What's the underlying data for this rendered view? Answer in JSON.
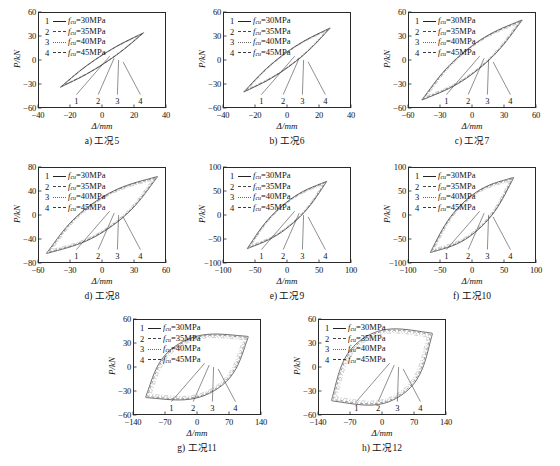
{
  "figure": {
    "axis_labels": {
      "x": "Δ/mm",
      "y": "P/kN"
    },
    "legend_series": [
      {
        "num": "1",
        "style": "solid",
        "label": "fcu=30MPa",
        "value": 30,
        "unit": "MPa"
      },
      {
        "num": "2",
        "style": "dash",
        "label": "fcu=35MPa",
        "value": 35,
        "unit": "MPa"
      },
      {
        "num": "3",
        "style": "dot",
        "label": "fcu=40MPa",
        "value": 40,
        "unit": "MPa"
      },
      {
        "num": "4",
        "style": "dashdot",
        "label": "fcu=45MPa",
        "value": 45,
        "unit": "MPa"
      }
    ],
    "callout_numbers": [
      "1",
      "2",
      "3",
      "4"
    ],
    "panels": [
      {
        "key": "a",
        "caption": "a) 工况5",
        "xlim": [
          -40,
          40
        ],
        "ylim": [
          -60,
          60
        ],
        "xticks": [
          -40,
          -20,
          0,
          20,
          40
        ],
        "yticks": [
          -60,
          -30,
          0,
          30,
          60
        ],
        "loop": "thin",
        "xpeak": 26,
        "ypeak": 34,
        "fatness": 0.1
      },
      {
        "key": "b",
        "caption": "b) 工况6",
        "xlim": [
          -40,
          40
        ],
        "ylim": [
          -60,
          60
        ],
        "xticks": [
          -40,
          -20,
          0,
          20,
          40
        ],
        "yticks": [
          -60,
          -30,
          0,
          30,
          60
        ],
        "loop": "thin",
        "xpeak": 27,
        "ypeak": 40,
        "fatness": 0.14
      },
      {
        "key": "c",
        "caption": "c) 工况7",
        "xlim": [
          -60,
          60
        ],
        "ylim": [
          -60,
          60
        ],
        "xticks": [
          -60,
          -30,
          0,
          30,
          60
        ],
        "yticks": [
          -60,
          -30,
          0,
          30,
          60
        ],
        "loop": "thin",
        "xpeak": 47,
        "ypeak": 50,
        "fatness": 0.2
      },
      {
        "key": "d",
        "caption": "d) 工况8",
        "xlim": [
          -60,
          60
        ],
        "ylim": [
          -80,
          80
        ],
        "xticks": [
          -60,
          -30,
          0,
          30,
          60
        ],
        "yticks": [
          -80,
          -40,
          0,
          40,
          80
        ],
        "loop": "med",
        "xpeak": 52,
        "ypeak": 64,
        "fatness": 0.26
      },
      {
        "key": "e",
        "caption": "e) 工况9",
        "xlim": [
          -100,
          100
        ],
        "ylim": [
          -100,
          100
        ],
        "xticks": [
          -100,
          -50,
          0,
          50,
          100
        ],
        "yticks": [
          -100,
          -50,
          0,
          50,
          100
        ],
        "loop": "med",
        "xpeak": 62,
        "ypeak": 70,
        "fatness": 0.22
      },
      {
        "key": "f",
        "caption": "f) 工况10",
        "xlim": [
          -100,
          100
        ],
        "ylim": [
          -100,
          100
        ],
        "xticks": [
          -100,
          -50,
          0,
          50,
          100
        ],
        "yticks": [
          -100,
          -50,
          0,
          50,
          100
        ],
        "loop": "med",
        "xpeak": 65,
        "ypeak": 78,
        "fatness": 0.3
      },
      {
        "key": "g",
        "caption": "g) 工况11",
        "xlim": [
          -140,
          140
        ],
        "ylim": [
          -60,
          60
        ],
        "xticks": [
          -140,
          -70,
          0,
          70,
          140
        ],
        "yticks": [
          -60,
          -30,
          0,
          30,
          60
        ],
        "loop": "fat",
        "xpeak": 112,
        "ypeak": 38,
        "fatness": 0.62
      },
      {
        "key": "h",
        "caption": "h) 工况12",
        "xlim": [
          -140,
          140
        ],
        "ylim": [
          -60,
          60
        ],
        "xticks": [
          -140,
          -70,
          0,
          70,
          140
        ],
        "yticks": [
          -60,
          -30,
          0,
          30,
          60
        ],
        "loop": "fat",
        "xpeak": 110,
        "ypeak": 42,
        "fatness": 0.68
      }
    ]
  }
}
